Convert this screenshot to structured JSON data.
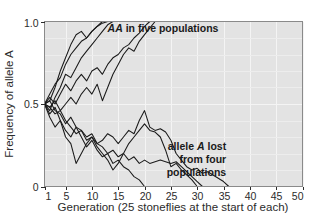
{
  "chart_data": {
    "type": "line",
    "title": "",
    "xlabel": "Generation (25 stoneflies at the start of each)",
    "ylabel": "Frequency of allele A",
    "xlim": [
      1,
      50
    ],
    "ylim": [
      0,
      1.0
    ],
    "xticks": [
      1,
      5,
      10,
      15,
      20,
      25,
      30,
      35,
      40,
      45,
      50
    ],
    "xtick_labels": [
      "1",
      "5",
      "10",
      "15",
      "20",
      "25",
      "30",
      "35",
      "40",
      "45",
      "50"
    ],
    "yticks": [
      0,
      0.5,
      1.0
    ],
    "ytick_labels": [
      "0",
      "0.5",
      "1.0"
    ],
    "grid": true,
    "grid_x_step": 5,
    "grid_y_step": 0.1,
    "legend_position": "none",
    "annotations": [
      {
        "name": "fixation-annotation",
        "text_parts": [
          {
            "text": "AA",
            "style": "bold-italic"
          },
          {
            "text": " in five populations",
            "style": "bold"
          }
        ],
        "plain_text": "AA in five populations",
        "x": 23.5,
        "y": 0.935
      },
      {
        "name": "loss-annotation",
        "lines": [
          [
            {
              "text": "allele ",
              "style": "bold"
            },
            {
              "text": "A",
              "style": "bold-italic"
            },
            {
              "text": " lost",
              "style": "bold"
            }
          ],
          [
            {
              "text": "from four",
              "style": "bold"
            }
          ],
          [
            {
              "text": "populations",
              "style": "bold"
            }
          ]
        ],
        "plain_text": "allele A lost from four populations",
        "x": 35.5,
        "y": 0.22
      }
    ],
    "series": [
      {
        "name": "population-1-fixed",
        "outcome": "fixed",
        "color": "#1a1a1a",
        "x": [
          1,
          2,
          3,
          4,
          5,
          6,
          7,
          8,
          9,
          10,
          11,
          12
        ],
        "values": [
          0.5,
          0.56,
          0.62,
          0.66,
          0.74,
          0.8,
          0.84,
          0.88,
          0.9,
          0.94,
          0.97,
          1.0
        ]
      },
      {
        "name": "population-2-fixed",
        "outcome": "fixed",
        "color": "#1a1a1a",
        "x": [
          1,
          2,
          3,
          4,
          5,
          6,
          7,
          8,
          9,
          10,
          11,
          12,
          13,
          14
        ],
        "values": [
          0.5,
          0.46,
          0.54,
          0.6,
          0.68,
          0.66,
          0.72,
          0.78,
          0.82,
          0.86,
          0.9,
          0.94,
          0.98,
          1.0
        ]
      },
      {
        "name": "population-3-fixed",
        "outcome": "fixed",
        "color": "#1a1a1a",
        "x": [
          1,
          2,
          3,
          4,
          5,
          6,
          7,
          8,
          9,
          10,
          11,
          12,
          13
        ],
        "values": [
          0.5,
          0.52,
          0.6,
          0.7,
          0.78,
          0.86,
          0.92,
          0.94,
          0.9,
          0.94,
          0.97,
          0.99,
          1.0
        ]
      },
      {
        "name": "population-4-fixed",
        "outcome": "fixed",
        "color": "#1a1a1a",
        "x": [
          1,
          2,
          3,
          4,
          5,
          6,
          7,
          8,
          9,
          10,
          11,
          12,
          13,
          14,
          15,
          16,
          17,
          18,
          19,
          20,
          21
        ],
        "values": [
          0.5,
          0.54,
          0.5,
          0.56,
          0.62,
          0.58,
          0.64,
          0.68,
          0.64,
          0.7,
          0.72,
          0.68,
          0.74,
          0.78,
          0.8,
          0.84,
          0.86,
          0.9,
          0.93,
          0.97,
          1.0
        ]
      },
      {
        "name": "population-5-fixed",
        "outcome": "fixed",
        "color": "#1a1a1a",
        "x": [
          1,
          2,
          3,
          4,
          5,
          6,
          7,
          8,
          9,
          10,
          11,
          12,
          13,
          14,
          15,
          16,
          17,
          18,
          19,
          20,
          21,
          22
        ],
        "values": [
          0.5,
          0.48,
          0.52,
          0.46,
          0.5,
          0.54,
          0.5,
          0.56,
          0.6,
          0.56,
          0.62,
          0.52,
          0.6,
          0.68,
          0.74,
          0.8,
          0.84,
          0.82,
          0.88,
          0.92,
          0.96,
          1.0
        ]
      },
      {
        "name": "population-6-lost",
        "outcome": "lost",
        "color": "#1a1a1a",
        "x": [
          1,
          2,
          3,
          4,
          5,
          6,
          7,
          8,
          9,
          10,
          11,
          12,
          13,
          14,
          15,
          16,
          17,
          18,
          19,
          20
        ],
        "values": [
          0.5,
          0.44,
          0.48,
          0.4,
          0.34,
          0.3,
          0.36,
          0.3,
          0.24,
          0.28,
          0.22,
          0.18,
          0.2,
          0.14,
          0.16,
          0.12,
          0.1,
          0.06,
          0.04,
          0.0
        ]
      },
      {
        "name": "population-7-lost",
        "outcome": "lost",
        "color": "#1a1a1a",
        "x": [
          1,
          2,
          3,
          4,
          5,
          6,
          7,
          8,
          9,
          10,
          11,
          12,
          13,
          14,
          15,
          16,
          17,
          18,
          19,
          20,
          21,
          22,
          23,
          24,
          25,
          26,
          27,
          28,
          29,
          30,
          31
        ],
        "values": [
          0.5,
          0.52,
          0.46,
          0.44,
          0.38,
          0.42,
          0.36,
          0.34,
          0.3,
          0.32,
          0.26,
          0.24,
          0.2,
          0.22,
          0.18,
          0.2,
          0.16,
          0.18,
          0.14,
          0.16,
          0.14,
          0.15,
          0.16,
          0.15,
          0.14,
          0.15,
          0.12,
          0.09,
          0.06,
          0.03,
          0.0
        ]
      },
      {
        "name": "population-8-lost",
        "outcome": "lost",
        "color": "#1a1a1a",
        "x": [
          1,
          2,
          3,
          4,
          5,
          6,
          7,
          8,
          9,
          10,
          11,
          12,
          13,
          14,
          15,
          16,
          17,
          18,
          19,
          20,
          21,
          22,
          23,
          24,
          25,
          26,
          27,
          28,
          29,
          30
        ],
        "values": [
          0.5,
          0.42,
          0.36,
          0.4,
          0.3,
          0.26,
          0.14,
          0.2,
          0.26,
          0.3,
          0.24,
          0.2,
          0.16,
          0.1,
          0.14,
          0.2,
          0.26,
          0.3,
          0.34,
          0.38,
          0.34,
          0.33,
          0.3,
          0.22,
          0.12,
          0.14,
          0.1,
          0.07,
          0.04,
          0.0
        ]
      },
      {
        "name": "population-9-lost",
        "outcome": "lost",
        "color": "#1a1a1a",
        "x": [
          1,
          2,
          3,
          4,
          5,
          6,
          7,
          8,
          9,
          10,
          11,
          12,
          13,
          14,
          15,
          16,
          17,
          18,
          19,
          20,
          21,
          22,
          23,
          24,
          25,
          26,
          27,
          28,
          29,
          30,
          31,
          32,
          33,
          34,
          35,
          36
        ],
        "values": [
          0.5,
          0.48,
          0.44,
          0.46,
          0.4,
          0.36,
          0.32,
          0.34,
          0.28,
          0.3,
          0.26,
          0.28,
          0.32,
          0.3,
          0.26,
          0.3,
          0.34,
          0.32,
          0.4,
          0.46,
          0.36,
          0.34,
          0.35,
          0.33,
          0.28,
          0.2,
          0.16,
          0.12,
          0.1,
          0.11,
          0.08,
          0.09,
          0.07,
          0.05,
          0.03,
          0.0
        ]
      }
    ]
  },
  "colors": {
    "plot_background": "#e3e3e3",
    "gridline": "#f4f4f4",
    "frame": "#8a8a8a",
    "trace": "#1a1a1a",
    "text": "#2b2b2b",
    "page_background": "#ffffff"
  }
}
